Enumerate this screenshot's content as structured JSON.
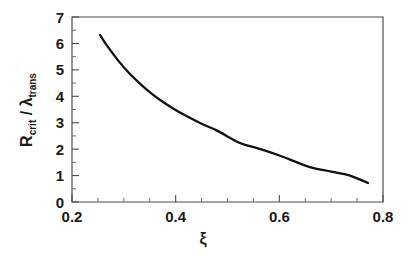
{
  "chart_data": {
    "type": "line",
    "title": "",
    "subtitle": "",
    "xlabel": "ξ",
    "ylabel": "R_crit / λ_trans",
    "ylabel_parts": {
      "main1": "R",
      "sub1": "crit",
      "separator": " / ",
      "main2": "λ",
      "sub2": "trans"
    },
    "xlim": [
      0.2,
      0.8
    ],
    "ylim": [
      0,
      7
    ],
    "x_ticks": [
      0.2,
      0.4,
      0.6,
      0.8
    ],
    "x_tick_labels": [
      "0.2",
      "0.4",
      "0.6",
      "0.8"
    ],
    "x_minor_tick_step": 0.05,
    "y_ticks": [
      0,
      1,
      2,
      3,
      4,
      5,
      6,
      7
    ],
    "y_tick_labels": [
      "0",
      "1",
      "2",
      "3",
      "4",
      "5",
      "6",
      "7"
    ],
    "y_minor_tick_step": 0.5,
    "grid": false,
    "legend": null,
    "legend_position": "none",
    "series": [
      {
        "name": "R_crit / λ_trans",
        "color": "#111111",
        "line_width": 2.3,
        "x": [
          0.254,
          0.27,
          0.29,
          0.31,
          0.33,
          0.35,
          0.37,
          0.395,
          0.42,
          0.45,
          0.48,
          0.524,
          0.56,
          0.6,
          0.659,
          0.7,
          0.735,
          0.771
        ],
        "y": [
          6.32,
          5.85,
          5.33,
          4.88,
          4.5,
          4.16,
          3.86,
          3.54,
          3.26,
          2.96,
          2.7,
          2.23,
          2.02,
          1.76,
          1.32,
          1.15,
          1.01,
          0.72
        ]
      }
    ],
    "annotations": []
  },
  "figure": {
    "background_color": "#ffffff",
    "frame_color": "#4d4d4d",
    "text_color": "#1a1a1a"
  }
}
